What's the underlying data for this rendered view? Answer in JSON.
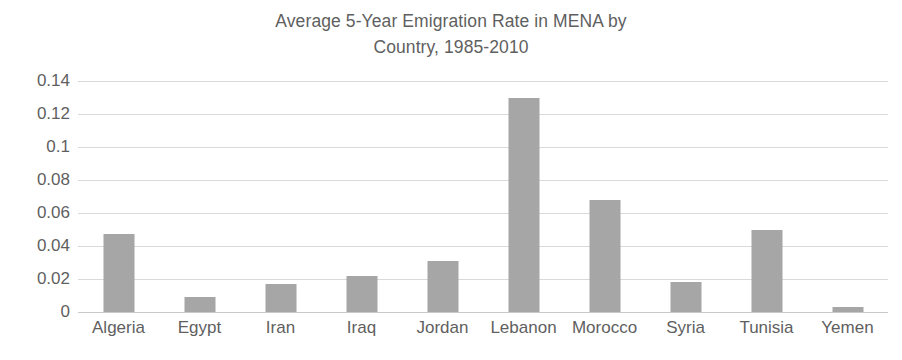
{
  "chart_data": {
    "type": "bar",
    "title": "Average 5-Year Emigration Rate in MENA by Country, 1985-2010",
    "title_line1": "Average 5-Year Emigration Rate in MENA by",
    "title_line2": "Country, 1985-2010",
    "xlabel": "",
    "ylabel": "",
    "categories": [
      "Algeria",
      "Egypt",
      "Iran",
      "Iraq",
      "Jordan",
      "Lebanon",
      "Morocco",
      "Syria",
      "Tunisia",
      "Yemen"
    ],
    "values": [
      0.047,
      0.009,
      0.017,
      0.022,
      0.031,
      0.13,
      0.068,
      0.018,
      0.05,
      0.003
    ],
    "ylim": [
      0,
      0.14
    ],
    "ytick_values": [
      0,
      0.02,
      0.04,
      0.06,
      0.08,
      0.1,
      0.12,
      0.14
    ],
    "ytick_labels": [
      "0",
      "0.02",
      "0.04",
      "0.06",
      "0.08",
      "0.1",
      "0.12",
      "0.14"
    ],
    "grid": true,
    "legend": false,
    "legend_position": "none",
    "bar_color": "#a6a6a6",
    "gridline_color": "#d9d9d9",
    "text_color": "#5f5f5f",
    "background_color": "#ffffff"
  }
}
